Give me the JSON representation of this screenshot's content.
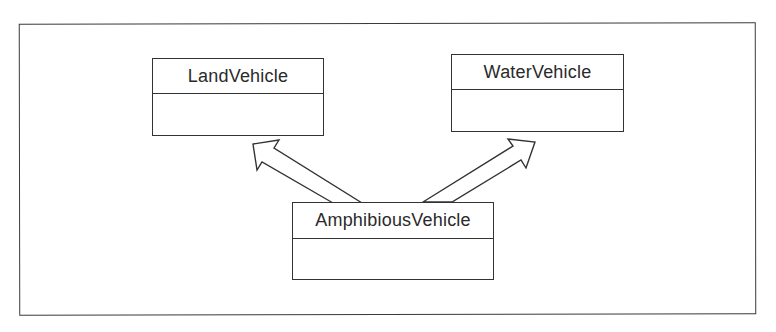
{
  "diagram": {
    "type": "UML class diagram (multiple inheritance)",
    "classes": [
      {
        "id": "land",
        "name": "LandVehicle"
      },
      {
        "id": "water",
        "name": "WaterVehicle"
      },
      {
        "id": "amphibious",
        "name": "AmphibiousVehicle"
      }
    ],
    "relations": [
      {
        "from": "AmphibiousVehicle",
        "to": "LandVehicle",
        "kind": "generalization"
      },
      {
        "from": "AmphibiousVehicle",
        "to": "WaterVehicle",
        "kind": "generalization"
      }
    ],
    "colors": {
      "line": "#333333",
      "background": "#ffffff",
      "text": "#2a2a2a"
    }
  }
}
